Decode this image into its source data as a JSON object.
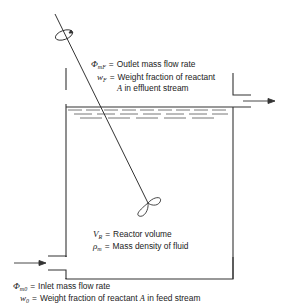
{
  "diagram": {
    "outlet": {
      "symbol": "Φ",
      "subscript": "mF",
      "equals": "=",
      "label": "Outlet mass flow rate",
      "w_symbol": "w",
      "w_subscript": "F",
      "w_label": "Weight fraction of reactant",
      "w_label_line2_species": "A",
      "w_label_line2": "in effluent stream"
    },
    "reactor": {
      "v_symbol": "V",
      "v_subscript": "R",
      "v_label": "Reactor volume",
      "rho_symbol": "ρ",
      "rho_subscript": "m",
      "rho_label": "Mass density of fluid"
    },
    "inlet": {
      "symbol": "Φ",
      "subscript": "m0",
      "label": "Inlet mass flow rate",
      "w_symbol": "w",
      "w_subscript": "0",
      "w_label_pre": "Weight fraction of reactant",
      "w_species": "A",
      "w_label_post": "in feed stream"
    },
    "equals": "=",
    "colors": {
      "line": "#333333",
      "text": "#222222",
      "background": "#ffffff"
    }
  }
}
